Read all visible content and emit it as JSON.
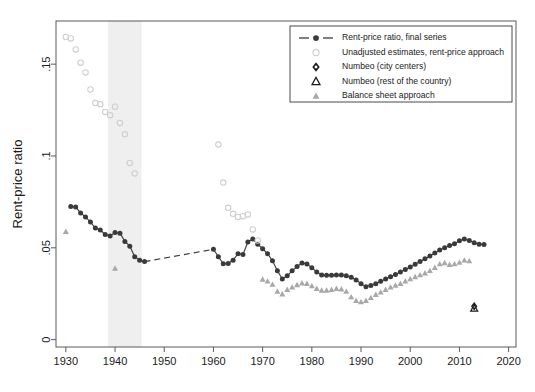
{
  "figure": {
    "background_color": "#ffffff",
    "frame_color": "#5a5a5a",
    "recession_band_color": "#efefef",
    "recession_band": {
      "start": 1938.6,
      "end": 1945.4,
      "label": "WWII shaded band"
    }
  },
  "axes": {
    "ylabel": "Rent-price ratio",
    "xlabel": "",
    "xlim": [
      1928.0,
      2021.5
    ],
    "ylim": [
      -0.004,
      0.1735
    ],
    "xticks": [
      1930,
      1940,
      1950,
      1960,
      1970,
      1980,
      1990,
      2000,
      2010,
      2020
    ],
    "xtick_labels": [
      "1930",
      "1940",
      "1950",
      "1960",
      "1970",
      "1980",
      "1990",
      "2000",
      "2010",
      "2020"
    ],
    "yticks": [
      0,
      0.05,
      0.1,
      0.15
    ],
    "ytick_labels": [
      "0",
      ".05",
      ".1",
      ".15"
    ],
    "grid": false
  },
  "legend": {
    "position": "top-right",
    "border_color": "#4a4a4a",
    "items": [
      {
        "label": "Rent-price ratio, final series",
        "marker": "line-circle",
        "color": "#3a3a3a"
      },
      {
        "label": "Unadjusted estimates, rent-price approach",
        "marker": "open-circle",
        "color": "#cfcfcf"
      },
      {
        "label": "Numbeo (city centers)",
        "marker": "diamond",
        "color": "#1a1a1a"
      },
      {
        "label": "Numbeo (rest of the country)",
        "marker": "open-triangle",
        "color": "#1a1a1a"
      },
      {
        "label": "Balance sheet approach",
        "marker": "filled-triangle",
        "color": "#a8a8a8"
      }
    ]
  },
  "chart_data": {
    "type": "scatter",
    "title": "",
    "xlabel": "",
    "ylabel": "Rent-price ratio",
    "xlim": [
      1928.0,
      2021.5
    ],
    "ylim": [
      -0.004,
      0.1735
    ],
    "grid": false,
    "legend_position": "top-right",
    "series": [
      {
        "name": "Rent-price ratio, final series",
        "marker": "filled-circle",
        "color": "#3a3a3a",
        "connected": true,
        "points": [
          [
            1931,
            0.0725
          ],
          [
            1932,
            0.0722
          ],
          [
            1933,
            0.069
          ],
          [
            1934,
            0.0668
          ],
          [
            1935,
            0.064
          ],
          [
            1936,
            0.0608
          ],
          [
            1937,
            0.0597
          ],
          [
            1938,
            0.0573
          ],
          [
            1939,
            0.0565
          ],
          [
            1940,
            0.0583
          ],
          [
            1941,
            0.058
          ],
          [
            1942,
            0.0535
          ],
          [
            1943,
            0.0509
          ],
          [
            1944,
            0.0452
          ],
          [
            1945,
            0.0432
          ],
          [
            1946,
            0.0425
          ],
          [
            1960,
            0.0492
          ],
          [
            1961,
            0.0452
          ],
          [
            1962,
            0.0413
          ],
          [
            1963,
            0.0415
          ],
          [
            1964,
            0.0433
          ],
          [
            1965,
            0.0468
          ],
          [
            1966,
            0.0463
          ],
          [
            1967,
            0.0532
          ],
          [
            1968,
            0.0548
          ],
          [
            1969,
            0.052
          ],
          [
            1970,
            0.0495
          ],
          [
            1971,
            0.0468
          ],
          [
            1972,
            0.043
          ],
          [
            1973,
            0.0375
          ],
          [
            1974,
            0.033
          ],
          [
            1975,
            0.0348
          ],
          [
            1976,
            0.0375
          ],
          [
            1977,
            0.0398
          ],
          [
            1978,
            0.0418
          ],
          [
            1979,
            0.0412
          ],
          [
            1980,
            0.0392
          ],
          [
            1981,
            0.0368
          ],
          [
            1982,
            0.0352
          ],
          [
            1983,
            0.035
          ],
          [
            1984,
            0.035
          ],
          [
            1985,
            0.0352
          ],
          [
            1986,
            0.0352
          ],
          [
            1987,
            0.0348
          ],
          [
            1988,
            0.034
          ],
          [
            1989,
            0.0325
          ],
          [
            1990,
            0.0305
          ],
          [
            1991,
            0.0288
          ],
          [
            1992,
            0.0295
          ],
          [
            1993,
            0.0305
          ],
          [
            1994,
            0.0318
          ],
          [
            1995,
            0.033
          ],
          [
            1996,
            0.0342
          ],
          [
            1997,
            0.0355
          ],
          [
            1998,
            0.0368
          ],
          [
            1999,
            0.0382
          ],
          [
            2000,
            0.0395
          ],
          [
            2001,
            0.041
          ],
          [
            2002,
            0.0425
          ],
          [
            2003,
            0.044
          ],
          [
            2004,
            0.0455
          ],
          [
            2005,
            0.0472
          ],
          [
            2006,
            0.0488
          ],
          [
            2007,
            0.05
          ],
          [
            2008,
            0.0512
          ],
          [
            2009,
            0.0522
          ],
          [
            2010,
            0.0538
          ],
          [
            2011,
            0.0548
          ],
          [
            2012,
            0.054
          ],
          [
            2013,
            0.0528
          ],
          [
            2014,
            0.052
          ],
          [
            2015,
            0.0518
          ]
        ],
        "gap_dashed_segment": {
          "from": [
            1946,
            0.0425
          ],
          "to": [
            1960,
            0.0492
          ]
        }
      },
      {
        "name": "Unadjusted estimates, rent-price approach",
        "marker": "open-circle",
        "color": "#cfcfcf",
        "connected": false,
        "points": [
          [
            1930,
            0.1648
          ],
          [
            1931,
            0.164
          ],
          [
            1932,
            0.158
          ],
          [
            1933,
            0.1508
          ],
          [
            1934,
            0.1455
          ],
          [
            1935,
            0.1362
          ],
          [
            1936,
            0.1288
          ],
          [
            1937,
            0.1282
          ],
          [
            1938,
            0.124
          ],
          [
            1939,
            0.1222
          ],
          [
            1940,
            0.1268
          ],
          [
            1941,
            0.118
          ],
          [
            1942,
            0.1118
          ],
          [
            1943,
            0.0962
          ],
          [
            1944,
            0.0905
          ],
          [
            1961,
            0.1062
          ],
          [
            1962,
            0.0855
          ],
          [
            1963,
            0.0718
          ],
          [
            1964,
            0.0685
          ],
          [
            1965,
            0.0668
          ],
          [
            1966,
            0.0672
          ],
          [
            1967,
            0.0682
          ],
          [
            1968,
            0.06
          ],
          [
            1969,
            0.054
          ]
        ]
      },
      {
        "name": "Balance sheet approach",
        "marker": "filled-triangle",
        "color": "#a8a8a8",
        "connected": false,
        "points": [
          [
            1930,
            0.0588
          ],
          [
            1940,
            0.0388
          ],
          [
            1970,
            0.0328
          ],
          [
            1971,
            0.0318
          ],
          [
            1972,
            0.03
          ],
          [
            1973,
            0.0262
          ],
          [
            1974,
            0.0248
          ],
          [
            1975,
            0.0272
          ],
          [
            1976,
            0.0285
          ],
          [
            1977,
            0.0298
          ],
          [
            1978,
            0.0308
          ],
          [
            1979,
            0.0305
          ],
          [
            1980,
            0.0292
          ],
          [
            1981,
            0.0278
          ],
          [
            1982,
            0.0268
          ],
          [
            1983,
            0.0268
          ],
          [
            1984,
            0.0272
          ],
          [
            1985,
            0.0278
          ],
          [
            1986,
            0.0275
          ],
          [
            1987,
            0.0262
          ],
          [
            1988,
            0.0232
          ],
          [
            1989,
            0.0212
          ],
          [
            1990,
            0.0205
          ],
          [
            1991,
            0.0212
          ],
          [
            1992,
            0.0228
          ],
          [
            1993,
            0.0245
          ],
          [
            1994,
            0.0258
          ],
          [
            1995,
            0.0272
          ],
          [
            1996,
            0.0285
          ],
          [
            1997,
            0.0295
          ],
          [
            1998,
            0.0305
          ],
          [
            1999,
            0.0318
          ],
          [
            2000,
            0.033
          ],
          [
            2001,
            0.0342
          ],
          [
            2002,
            0.0352
          ],
          [
            2003,
            0.0362
          ],
          [
            2004,
            0.0375
          ],
          [
            2005,
            0.0392
          ],
          [
            2006,
            0.0412
          ],
          [
            2007,
            0.0418
          ],
          [
            2008,
            0.0408
          ],
          [
            2009,
            0.0412
          ],
          [
            2010,
            0.042
          ],
          [
            2011,
            0.0432
          ],
          [
            2012,
            0.0428
          ]
        ]
      },
      {
        "name": "Numbeo (city centers)",
        "marker": "diamond",
        "color": "#1a1a1a",
        "connected": false,
        "points": [
          [
            2013,
            0.0182
          ]
        ]
      },
      {
        "name": "Numbeo (rest of the country)",
        "marker": "open-triangle",
        "color": "#1a1a1a",
        "connected": false,
        "points": [
          [
            2013,
            0.017
          ]
        ]
      }
    ]
  }
}
